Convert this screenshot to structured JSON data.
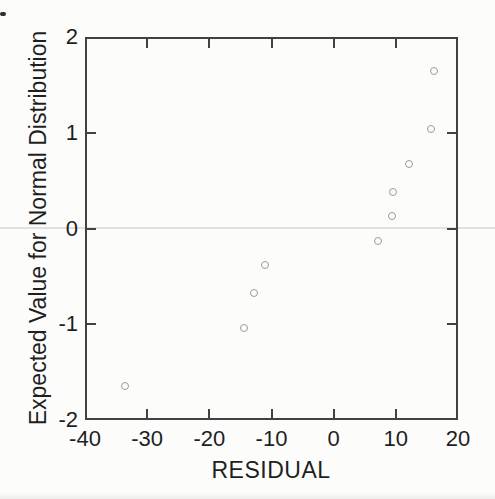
{
  "chart_data": {
    "type": "scatter",
    "title": "",
    "xlabel": "RESIDUAL",
    "ylabel": "Expected Value for Normal Distribution",
    "xlim": [
      -40,
      20
    ],
    "ylim": [
      -2,
      2
    ],
    "xticks": [
      -40,
      -30,
      -20,
      -10,
      0,
      10,
      20
    ],
    "yticks": [
      -2,
      -1,
      0,
      1,
      2
    ],
    "points": [
      {
        "x": -33.6,
        "y": -1.645
      },
      {
        "x": -14.4,
        "y": -1.036
      },
      {
        "x": -12.8,
        "y": -0.674
      },
      {
        "x": -11.0,
        "y": -0.385
      },
      {
        "x": 7.2,
        "y": -0.126
      },
      {
        "x": 9.4,
        "y": 0.126
      },
      {
        "x": 9.6,
        "y": 0.385
      },
      {
        "x": 12.1,
        "y": 0.674
      },
      {
        "x": 15.6,
        "y": 1.036
      },
      {
        "x": 16.2,
        "y": 1.645
      }
    ],
    "marker": {
      "shape": "open-circle",
      "diameter_px": 8,
      "color": "#9b9b9b"
    },
    "layout_hints": {
      "boxed_axes": true,
      "tick_direction": "in",
      "grid": false,
      "zero_reference_line": true,
      "legend": "none"
    }
  },
  "colors": {
    "axis": "#414141",
    "text": "#1f1f1f",
    "marker": "#9b9b9b",
    "zero_line": "#e0e0e0",
    "background": "#fcfcfb"
  }
}
